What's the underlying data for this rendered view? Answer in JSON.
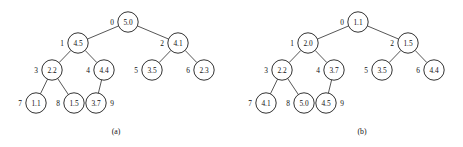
{
  "figure": {
    "background_color": "#ffffff",
    "stroke_color": "#1c1c1c",
    "text_color": "#111111",
    "node_radius": 10.2,
    "panels": [
      {
        "id": "panel-a",
        "caption": "(a)",
        "caption_x": 116,
        "caption_y": 131,
        "nodes": [
          {
            "index": "0",
            "value": "5.0",
            "cx": 128,
            "cy": 22,
            "index_dx": -16,
            "index_dy": 0
          },
          {
            "index": "1",
            "value": "4.5",
            "cx": 78,
            "cy": 43,
            "index_dx": -16,
            "index_dy": 0
          },
          {
            "index": "2",
            "value": "4.1",
            "cx": 178,
            "cy": 43,
            "index_dx": -16,
            "index_dy": 0
          },
          {
            "index": "3",
            "value": "2.2",
            "cx": 52,
            "cy": 70,
            "index_dx": -16,
            "index_dy": 0
          },
          {
            "index": "4",
            "value": "4.4",
            "cx": 104,
            "cy": 70,
            "index_dx": -16,
            "index_dy": 0
          },
          {
            "index": "5",
            "value": "3.5",
            "cx": 152,
            "cy": 70,
            "index_dx": -16,
            "index_dy": 0
          },
          {
            "index": "6",
            "value": "2.3",
            "cx": 204,
            "cy": 70,
            "index_dx": -16,
            "index_dy": 0
          },
          {
            "index": "7",
            "value": "1.1",
            "cx": 36,
            "cy": 103,
            "index_dx": -16,
            "index_dy": 0
          },
          {
            "index": "8",
            "value": "1.5",
            "cx": 74,
            "cy": 103,
            "index_dx": -16,
            "index_dy": 0
          },
          {
            "index": "9",
            "value": "3.7",
            "cx": 96,
            "cy": 103,
            "index_dx": 16,
            "index_dy": 0
          }
        ],
        "edges": [
          {
            "from": "0",
            "to": "1"
          },
          {
            "from": "0",
            "to": "2"
          },
          {
            "from": "1",
            "to": "3"
          },
          {
            "from": "1",
            "to": "4"
          },
          {
            "from": "2",
            "to": "5"
          },
          {
            "from": "2",
            "to": "6"
          },
          {
            "from": "3",
            "to": "7"
          },
          {
            "from": "3",
            "to": "8"
          },
          {
            "from": "4",
            "to": "9"
          }
        ]
      },
      {
        "id": "panel-b",
        "caption": "(b)",
        "caption_x": 362,
        "caption_y": 131,
        "nodes": [
          {
            "index": "0",
            "value": "1.1",
            "cx": 358,
            "cy": 22,
            "index_dx": -16,
            "index_dy": 0
          },
          {
            "index": "1",
            "value": "2.0",
            "cx": 308,
            "cy": 43,
            "index_dx": -16,
            "index_dy": 0
          },
          {
            "index": "2",
            "value": "1.5",
            "cx": 408,
            "cy": 43,
            "index_dx": -16,
            "index_dy": 0
          },
          {
            "index": "3",
            "value": "2.2",
            "cx": 282,
            "cy": 70,
            "index_dx": -16,
            "index_dy": 0
          },
          {
            "index": "4",
            "value": "3.7",
            "cx": 334,
            "cy": 70,
            "index_dx": -16,
            "index_dy": 0
          },
          {
            "index": "5",
            "value": "3.5",
            "cx": 382,
            "cy": 70,
            "index_dx": -16,
            "index_dy": 0
          },
          {
            "index": "6",
            "value": "4.4",
            "cx": 434,
            "cy": 70,
            "index_dx": -16,
            "index_dy": 0
          },
          {
            "index": "7",
            "value": "4.1",
            "cx": 266,
            "cy": 103,
            "index_dx": -16,
            "index_dy": 0
          },
          {
            "index": "8",
            "value": "5.0",
            "cx": 304,
            "cy": 103,
            "index_dx": -16,
            "index_dy": 0
          },
          {
            "index": "9",
            "value": "4.5",
            "cx": 326,
            "cy": 103,
            "index_dx": 16,
            "index_dy": 0
          }
        ],
        "edges": [
          {
            "from": "0",
            "to": "1"
          },
          {
            "from": "0",
            "to": "2"
          },
          {
            "from": "1",
            "to": "3"
          },
          {
            "from": "1",
            "to": "4"
          },
          {
            "from": "2",
            "to": "5"
          },
          {
            "from": "2",
            "to": "6"
          },
          {
            "from": "3",
            "to": "7"
          },
          {
            "from": "3",
            "to": "8"
          },
          {
            "from": "4",
            "to": "9"
          }
        ]
      }
    ]
  }
}
